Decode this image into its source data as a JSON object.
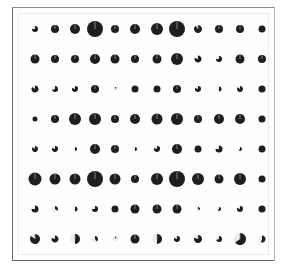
{
  "chart_data": {
    "type": "scatter",
    "subtype": "pie-glyph grid",
    "title": "",
    "xlabel": "",
    "ylabel": "",
    "grid": false,
    "legend": null,
    "columns": 12,
    "rows": 8,
    "col_x": [
      35,
      55,
      75,
      95,
      115,
      135,
      157,
      177,
      198,
      219,
      240,
      262
    ],
    "row_y": [
      29,
      59,
      89,
      119,
      149,
      179,
      209,
      239
    ],
    "colors": {
      "fill": "#1e1e1e",
      "remainder": "#d8d8d8",
      "frame": "#6a6a6a"
    },
    "cells": [
      [
        [
          3,
          0.75
        ],
        [
          4,
          1
        ],
        [
          5,
          1
        ],
        [
          8,
          1
        ],
        [
          4,
          1
        ],
        [
          5,
          1
        ],
        [
          6,
          1
        ],
        [
          8,
          1
        ],
        [
          4,
          0.9
        ],
        [
          4,
          1
        ],
        [
          4,
          1
        ],
        [
          3.5,
          1
        ]
      ],
      [
        [
          4.5,
          1
        ],
        [
          4,
          1
        ],
        [
          4,
          1
        ],
        [
          5,
          1
        ],
        [
          4.5,
          1
        ],
        [
          4,
          1
        ],
        [
          4.5,
          1
        ],
        [
          6,
          1
        ],
        [
          3.5,
          0.8
        ],
        [
          3,
          0.75
        ],
        [
          4.5,
          1
        ],
        [
          4,
          1
        ]
      ],
      [
        [
          3.5,
          0.85
        ],
        [
          3,
          0.7
        ],
        [
          3,
          0.8
        ],
        [
          4,
          1
        ],
        [
          2,
          0.15
        ],
        [
          3.5,
          1
        ],
        [
          3.5,
          1
        ],
        [
          4,
          1
        ],
        [
          3,
          0.8
        ],
        [
          2.5,
          0.5
        ],
        [
          3,
          0.85
        ],
        [
          3.5,
          1
        ]
      ],
      [
        [
          2.5,
          1
        ],
        [
          4,
          1
        ],
        [
          6,
          1
        ],
        [
          6,
          1
        ],
        [
          4,
          1
        ],
        [
          5,
          1
        ],
        [
          5.5,
          1
        ],
        [
          6,
          1
        ],
        [
          4,
          1
        ],
        [
          5,
          1
        ],
        [
          5,
          1
        ],
        [
          3.5,
          1
        ]
      ],
      [
        [
          3,
          0.85
        ],
        [
          3,
          0.8
        ],
        [
          2,
          0.5
        ],
        [
          5,
          1
        ],
        [
          4,
          1
        ],
        [
          2,
          0.5
        ],
        [
          3,
          0.8
        ],
        [
          5,
          1
        ],
        [
          3.5,
          1
        ],
        [
          3.5,
          0.75
        ],
        [
          2,
          0.6
        ],
        [
          3.5,
          1
        ]
      ],
      [
        [
          6.5,
          1
        ],
        [
          5.5,
          1
        ],
        [
          5.5,
          1
        ],
        [
          8,
          1
        ],
        [
          5.5,
          1
        ],
        [
          4,
          1
        ],
        [
          6,
          1
        ],
        [
          8,
          1
        ],
        [
          6,
          1
        ],
        [
          4.5,
          1
        ],
        [
          6,
          1
        ],
        [
          3.5,
          1
        ]
      ],
      [
        [
          3.5,
          0.75
        ],
        [
          3,
          0.35
        ],
        [
          2.5,
          0.5
        ],
        [
          3,
          0.75
        ],
        [
          3.5,
          1
        ],
        [
          4.5,
          1
        ],
        [
          4.5,
          1
        ],
        [
          4.5,
          1
        ],
        [
          2,
          0.35
        ],
        [
          2,
          0.6
        ],
        [
          3,
          0.8
        ],
        [
          3.5,
          1
        ]
      ],
      [
        [
          5,
          0.85
        ],
        [
          3.5,
          0.8
        ],
        [
          5,
          0.5
        ],
        [
          3,
          0.4
        ],
        [
          2.5,
          0.1
        ],
        [
          4.5,
          1
        ],
        [
          5,
          0.5
        ],
        [
          3,
          0.8
        ],
        [
          4,
          0.8
        ],
        [
          3,
          0.7
        ],
        [
          6,
          0.65
        ],
        [
          3.5,
          0.55
        ]
      ]
    ]
  }
}
